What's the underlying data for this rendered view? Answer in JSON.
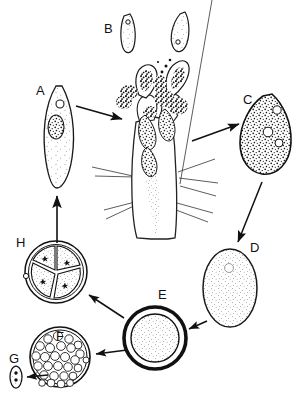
{
  "figure": {
    "style": "black-and-white stippled line drawing",
    "background_color": "#ffffff",
    "ink_color": "#111111",
    "stage_labels": [
      {
        "id": "A",
        "label": "A",
        "x": 36,
        "y": 84,
        "stage_name": "elongate-spindle-cell",
        "description": "Elongate spindle-shaped trophozoite with stippled cytoplasm, one large oval nucleus and a small round vacuole"
      },
      {
        "id": "B",
        "label": "B",
        "x": 104,
        "y": 22,
        "stage_name": "detached-merozoites",
        "description": "Two free elongate merozoites, each with a small dark nucleus"
      },
      {
        "id": "C",
        "label": "C",
        "x": 243,
        "y": 93,
        "stage_name": "pear-shaped-gamont",
        "description": "Pear / teardrop shaped cell with coarse dense granular contents"
      },
      {
        "id": "D",
        "label": "D",
        "x": 250,
        "y": 241,
        "stage_name": "oval-zygote",
        "description": "Smooth oval zygote with fine even stippling"
      },
      {
        "id": "E",
        "label": "E",
        "x": 158,
        "y": 288,
        "stage_name": "thick-walled-oocyst",
        "description": "Round oocyst with a thick dark double wall and finely stippled contents"
      },
      {
        "id": "F",
        "label": "F",
        "x": 56,
        "y": 330,
        "stage_name": "sporoblast-mass",
        "description": "Spherical cyst packed with many small rounded sporoblasts"
      },
      {
        "id": "G",
        "label": "G",
        "x": 9,
        "y": 352,
        "stage_name": "sporozoite",
        "description": "Single tiny elongate sporozoite with small internal dark bodies"
      },
      {
        "id": "H",
        "label": "H",
        "x": 16,
        "y": 236,
        "stage_name": "four-celled-stage",
        "description": "Round cyst divided into four wedge cells, each containing a star-shaped nucleus"
      }
    ],
    "central_structure": {
      "name": "host-gut-villus",
      "description": "Vertical tubular host villus bearing radiating bristle lines, with granular parasites attached along its surface and two parasites emerging from its apex"
    },
    "arrows": [
      {
        "name": "arrow-a-to-villus",
        "from": "A",
        "to": "villus",
        "direction": "right-down"
      },
      {
        "name": "arrow-villus-to-c",
        "from": "villus",
        "to": "C",
        "direction": "right-up"
      },
      {
        "name": "arrow-c-to-d",
        "from": "C",
        "to": "D",
        "direction": "down-left"
      },
      {
        "name": "arrow-d-to-e",
        "from": "D",
        "to": "E",
        "direction": "left"
      },
      {
        "name": "arrow-e-to-h",
        "from": "E",
        "to": "H",
        "direction": "up-left"
      },
      {
        "name": "arrow-e-to-f",
        "from": "E",
        "to": "F",
        "direction": "down-left"
      },
      {
        "name": "arrow-f-to-g",
        "from": "F",
        "to": "G",
        "direction": "left"
      },
      {
        "name": "arrow-h-to-a",
        "from": "H",
        "to": "A",
        "direction": "up"
      }
    ]
  }
}
